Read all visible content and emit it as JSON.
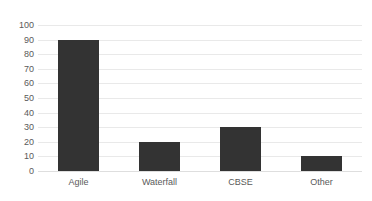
{
  "chart_data": {
    "type": "bar",
    "title": "",
    "subtitle": "",
    "xlabel": "",
    "ylabel": "",
    "categories": [
      "Agile",
      "Waterfall",
      "CBSE",
      "Other"
    ],
    "values": [
      90,
      20,
      30,
      10
    ],
    "ylim": [
      0,
      100
    ],
    "ytick_labels": [
      "0",
      "10",
      "20",
      "30",
      "40",
      "50",
      "60",
      "70",
      "80",
      "90",
      "100"
    ],
    "ytick_values": [
      0,
      10,
      20,
      30,
      40,
      50,
      60,
      70,
      80,
      90,
      100
    ],
    "grid": "horizontal",
    "legend": "none",
    "annotations": [],
    "colors": {
      "bar": "#333333",
      "gridline": "#e9e9e9",
      "baseline": "#dedede",
      "tick_text": "#5a5a5a",
      "background": "#ffffff"
    }
  }
}
